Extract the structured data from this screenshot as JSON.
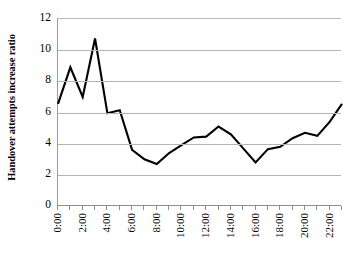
{
  "chart_data": {
    "type": "line",
    "title": "",
    "xlabel": "",
    "ylabel": "Handover attempts increase ratio",
    "x": [
      "0:00",
      "1:00",
      "2:00",
      "3:00",
      "4:00",
      "5:00",
      "6:00",
      "7:00",
      "8:00",
      "9:00",
      "10:00",
      "11:00",
      "12:00",
      "13:00",
      "14:00",
      "15:00",
      "16:00",
      "17:00",
      "18:00",
      "19:00",
      "20:00",
      "21:00",
      "22:00",
      "23:00"
    ],
    "values": [
      6.55,
      8.9,
      7.0,
      10.75,
      5.95,
      6.15,
      3.6,
      3.0,
      2.7,
      3.4,
      3.9,
      4.4,
      4.45,
      5.1,
      4.6,
      3.7,
      2.8,
      3.65,
      3.8,
      4.35,
      4.7,
      4.5,
      5.4,
      6.55
    ],
    "series": [
      {
        "name": "Handover attempts increase ratio",
        "values": [
          6.55,
          8.9,
          7.0,
          10.75,
          5.95,
          6.15,
          3.6,
          3.0,
          2.7,
          3.4,
          3.9,
          4.4,
          4.45,
          5.1,
          4.6,
          3.7,
          2.8,
          3.65,
          3.8,
          4.35,
          4.7,
          4.5,
          5.4,
          6.55
        ],
        "color": "#000000"
      }
    ],
    "x_tick_labels": [
      "0:00",
      "2:00",
      "4:00",
      "6:00",
      "8:00",
      "10:00",
      "12:00",
      "14:00",
      "16:00",
      "18:00",
      "20:00",
      "22:00"
    ],
    "x_tick_indices": [
      0,
      2,
      4,
      6,
      8,
      10,
      12,
      14,
      16,
      18,
      20,
      22
    ],
    "y_tick_labels": [
      "0",
      "2",
      "4",
      "6",
      "8",
      "10",
      "12"
    ],
    "y_ticks": [
      0,
      2,
      4,
      6,
      8,
      10,
      12
    ],
    "ylim": [
      0,
      12
    ],
    "xlim": [
      0,
      23
    ],
    "grid": "horizontal",
    "legend": "none",
    "line_color": "#000000",
    "grid_color": "#b5b5b5",
    "axis_color": "#8f8f8f",
    "background_color": "#ffffff"
  }
}
